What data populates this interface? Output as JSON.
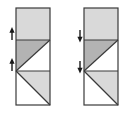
{
  "figure": {
    "width": 124,
    "height": 114,
    "background_color": "#ffffff",
    "stroke_color": "#3a3a3a",
    "stroke_width": 1.2,
    "fills": {
      "light_gray": "#d9d9d9",
      "medium_gray": "#b3b3b3",
      "white": "#ffffff"
    },
    "panels": [
      {
        "id": "left-panel",
        "label": "Left panel",
        "arrow_direction": "up",
        "arrow_glyph": "▲",
        "rect": {
          "x": 16,
          "y": 8,
          "width": 34,
          "height": 97
        },
        "dividers_y": [
          40,
          71
        ],
        "bands": [
          {
            "id": "left-band-top",
            "label": "Top band",
            "y_from": 8,
            "y_to": 40,
            "pattern": "solid",
            "fill": "light_gray"
          },
          {
            "id": "left-band-middle",
            "label": "Middle band",
            "y_from": 40,
            "y_to": 71,
            "pattern": "diagonal-tr-to-bl",
            "fill_upper_left": "medium_gray",
            "fill_lower_right": "white"
          },
          {
            "id": "left-band-bottom",
            "label": "Bottom band",
            "y_from": 71,
            "y_to": 105,
            "pattern": "diagonal-tl-to-br",
            "fill_upper_right": "light_gray",
            "fill_lower_left": "white"
          }
        ],
        "arrows": [
          {
            "id": "left-arrow-upper",
            "x": 12,
            "y": 40,
            "direction": "up"
          },
          {
            "id": "left-arrow-lower",
            "x": 12,
            "y": 71,
            "direction": "up"
          }
        ]
      },
      {
        "id": "right-panel",
        "label": "Right panel",
        "arrow_direction": "down",
        "arrow_glyph": "▼",
        "rect": {
          "x": 84,
          "y": 8,
          "width": 34,
          "height": 97
        },
        "dividers_y": [
          40,
          71
        ],
        "bands": [
          {
            "id": "right-band-top",
            "label": "Top band",
            "y_from": 8,
            "y_to": 40,
            "pattern": "solid",
            "fill": "light_gray"
          },
          {
            "id": "right-band-middle",
            "label": "Middle band",
            "y_from": 40,
            "y_to": 71,
            "pattern": "diagonal-tr-to-bl",
            "fill_upper_left": "medium_gray",
            "fill_lower_right": "white"
          },
          {
            "id": "right-band-bottom",
            "label": "Bottom band",
            "y_from": 71,
            "y_to": 105,
            "pattern": "diagonal-tl-to-br",
            "fill_upper_right": "light_gray",
            "fill_lower_left": "white"
          }
        ],
        "arrows": [
          {
            "id": "right-arrow-upper",
            "x": 80,
            "y": 40,
            "direction": "down"
          },
          {
            "id": "right-arrow-lower",
            "x": 80,
            "y": 71,
            "direction": "down"
          }
        ]
      }
    ]
  }
}
